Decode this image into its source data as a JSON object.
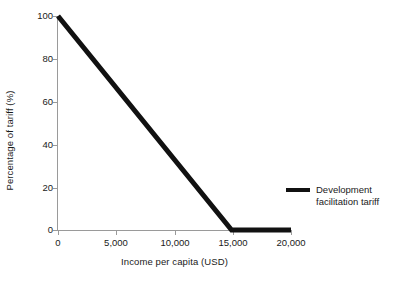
{
  "chart_data": {
    "type": "line",
    "title": "",
    "xlabel": "Income per capita (USD)",
    "ylabel": "Percentage of tariff (%)",
    "xlim": [
      0,
      20000
    ],
    "ylim": [
      0,
      100
    ],
    "grid": false,
    "legend_position": "right",
    "xticks": [
      0,
      5000,
      10000,
      15000,
      20000
    ],
    "xticklabels": [
      "0",
      "5,000",
      "10,000",
      "15,000",
      "20,000"
    ],
    "yticks": [
      0,
      20,
      40,
      60,
      80,
      100
    ],
    "yticklabels": [
      "0",
      "20",
      "40",
      "60",
      "80",
      "100"
    ],
    "series": [
      {
        "name": "Development facilitation tariff",
        "legend_label": "Development\nfacilitation tariff",
        "color": "#111111",
        "linewidth": 5,
        "x": [
          0,
          14900,
          20000
        ],
        "values": [
          100,
          0,
          0
        ]
      }
    ]
  },
  "axis": {
    "x_title": "Income per capita (USD)",
    "y_title": "Percentage of tariff (%)"
  },
  "legend": {
    "entry_label": "Development\nfacilitation tariff"
  }
}
